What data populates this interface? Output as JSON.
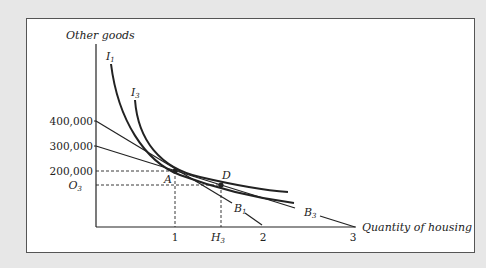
{
  "diagram": {
    "y_axis_label": "Other goods",
    "x_axis_label": "Quantity of housing",
    "y_ticks": [
      "400,000",
      "300,000",
      "200,000"
    ],
    "y_tick_O": "O",
    "y_tick_O_sub": "3",
    "x_ticks": [
      "1",
      "2",
      "3"
    ],
    "x_tick_H": "H",
    "x_tick_H_sub": "3",
    "curves": {
      "I1": {
        "label": "I",
        "sub": "1"
      },
      "I3": {
        "label": "I",
        "sub": "3"
      }
    },
    "budget_lines": {
      "B1": {
        "label": "B",
        "sub": "1"
      },
      "B3": {
        "label": "B",
        "sub": "3"
      }
    },
    "points": {
      "A": "A",
      "D": "D"
    },
    "colors": {
      "background": "#e7e7e7",
      "panel": "#ffffff",
      "line": "#222222"
    }
  }
}
